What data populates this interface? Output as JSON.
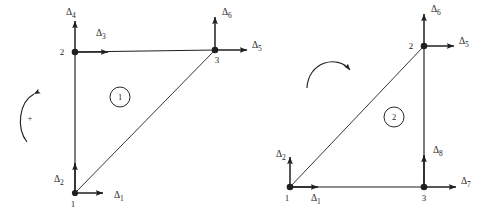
{
  "figure": {
    "background_color": "#ffffff",
    "ink_color": "#1f1f1f",
    "symbol": "Δ",
    "width": 487,
    "height": 224
  },
  "elements": [
    {
      "number": "1",
      "circle_center": [
        120,
        97
      ],
      "circle_radius": 10,
      "rotation": {
        "direction": "counterclockwise",
        "sign_label": "+",
        "sign_position": [
          28,
          118
        ]
      },
      "nodes": [
        {
          "label": "1",
          "x": 75,
          "y": 193,
          "label_dx": -2,
          "label_dy": 14
        },
        {
          "label": "2",
          "x": 75,
          "y": 52,
          "label_dx": -13,
          "label_dy": 3
        },
        {
          "label": "3",
          "x": 215,
          "y": 50,
          "label_dx": 2,
          "label_dy": 13
        }
      ],
      "arrows": [
        {
          "label": "Δ",
          "sub": "1",
          "node": "1",
          "dir": "right",
          "length": 28,
          "text_x": 114,
          "text_y": 198
        },
        {
          "label": "Δ",
          "sub": "2",
          "node": "1",
          "dir": "up",
          "length": 30,
          "text_x": 54,
          "text_y": 182
        },
        {
          "label": "Δ",
          "sub": "3",
          "node": "2",
          "dir": "right",
          "length": 33,
          "text_x": 96,
          "text_y": 36
        },
        {
          "label": "Δ",
          "sub": "4",
          "node": "2",
          "dir": "up",
          "length": 31,
          "text_x": 66,
          "text_y": 15
        },
        {
          "label": "Δ",
          "sub": "5",
          "node": "3",
          "dir": "right",
          "length": 32,
          "text_x": 252,
          "text_y": 48
        },
        {
          "label": "Δ",
          "sub": "6",
          "node": "3",
          "dir": "up",
          "length": 33,
          "text_x": 222,
          "text_y": 15
        }
      ]
    },
    {
      "number": "2",
      "circle_center": [
        394,
        117
      ],
      "circle_radius": 10,
      "rotation": {
        "direction": "clockwise",
        "sign_label": "",
        "sign_position": [
          0,
          0
        ]
      },
      "nodes": [
        {
          "label": "1",
          "x": 290,
          "y": 187,
          "label_dx": -3,
          "label_dy": 14
        },
        {
          "label": "2",
          "x": 424,
          "y": 46,
          "label_dx": -13,
          "label_dy": 3
        },
        {
          "label": "3",
          "x": 424,
          "y": 187,
          "label_dx": -2,
          "label_dy": 14
        }
      ],
      "arrows": [
        {
          "label": "Δ",
          "sub": "1",
          "node": "1",
          "dir": "right",
          "length": 28,
          "text_x": 313,
          "text_y": 201
        },
        {
          "label": "Δ",
          "sub": "2",
          "node": "1",
          "dir": "up",
          "length": 30,
          "text_x": 278,
          "text_y": 157
        },
        {
          "label": "Δ",
          "sub": "5",
          "node": "2",
          "dir": "right",
          "length": 30,
          "text_x": 460,
          "text_y": 44
        },
        {
          "label": "Δ",
          "sub": "6",
          "node": "2",
          "dir": "up",
          "length": 32,
          "text_x": 432,
          "text_y": 12
        },
        {
          "label": "Δ",
          "sub": "7",
          "node": "3",
          "dir": "right",
          "length": 32,
          "text_x": 461,
          "text_y": 184
        },
        {
          "label": "Δ",
          "sub": "8",
          "node": "3",
          "dir": "up",
          "length": 32,
          "text_x": 434,
          "text_y": 153
        }
      ]
    }
  ]
}
